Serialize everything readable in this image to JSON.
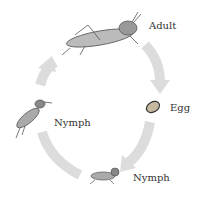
{
  "diagram": {
    "stages": [
      {
        "id": "adult",
        "label": "Adult"
      },
      {
        "id": "egg",
        "label": "Egg"
      },
      {
        "id": "nymph-1",
        "label": "Nymph"
      },
      {
        "id": "nymph-2",
        "label": "Nymph"
      }
    ],
    "arrow_color": "#dcdcdc",
    "sequence": [
      "adult",
      "egg",
      "nymph-1",
      "nymph-2",
      "adult"
    ]
  }
}
